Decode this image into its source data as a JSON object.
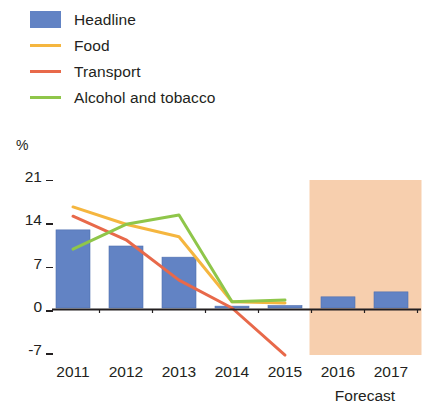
{
  "legend": {
    "items": [
      {
        "label": "Headline",
        "color": "#6283c4",
        "marker": "bar"
      },
      {
        "label": "Food",
        "color": "#f5b63f",
        "marker": "line"
      },
      {
        "label": "Transport",
        "color": "#e8694a",
        "marker": "line"
      },
      {
        "label": "Alcohol and tobacco",
        "color": "#8fc64a",
        "marker": "line"
      }
    ]
  },
  "axes": {
    "y_unit": "%",
    "y_ticks": [
      "21",
      "14",
      "7",
      "0",
      "-7"
    ],
    "x_ticks": [
      "2011",
      "2012",
      "2013",
      "2014",
      "2015",
      "2016",
      "2017"
    ],
    "forecast_caption": "Forecast"
  },
  "chart_data": {
    "type": "bar",
    "title": "",
    "subtitle": "",
    "xlabel": "",
    "ylabel": "%",
    "ylim": [
      -9,
      23
    ],
    "yticks": [
      21,
      14,
      7,
      0,
      -7
    ],
    "grid": false,
    "legend_position": "top-left",
    "categories": [
      "2011",
      "2012",
      "2013",
      "2014",
      "2015",
      "2016",
      "2017"
    ],
    "series": [
      {
        "name": "Headline",
        "type": "bar",
        "color": "#6283c4",
        "values": [
          12.6,
          10.0,
          8.2,
          0.3,
          0.4,
          1.8,
          2.6
        ]
      },
      {
        "name": "Food",
        "type": "line",
        "color": "#f5b63f",
        "values": [
          16.3,
          13.5,
          11.5,
          1.0,
          0.8,
          null,
          null
        ]
      },
      {
        "name": "Transport",
        "type": "line",
        "color": "#e8694a",
        "values": [
          14.8,
          11.0,
          4.5,
          0.0,
          -7.6,
          null,
          null
        ]
      },
      {
        "name": "Alcohol and tobacco",
        "type": "line",
        "color": "#8fc64a",
        "values": [
          9.5,
          13.5,
          15.0,
          1.0,
          1.3,
          null,
          null
        ]
      }
    ],
    "annotations": [
      {
        "type": "shaded-band",
        "label": "Forecast",
        "from": "2015.5",
        "to": "2017.5",
        "color": "#f7cfae"
      }
    ]
  }
}
